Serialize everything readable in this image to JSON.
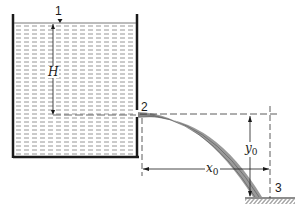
{
  "diagram": {
    "type": "tank-orifice-jet",
    "labels": {
      "point1": "1",
      "point2": "2",
      "point3": "3",
      "head": "H",
      "x_var": "x",
      "x_sub": "0",
      "y_var": "y",
      "y_sub": "0"
    },
    "colors": {
      "ink": "#1a1a1a",
      "water_dash": "#7a7a7a",
      "jet": "#8c8c8c",
      "background": "#ffffff"
    }
  }
}
